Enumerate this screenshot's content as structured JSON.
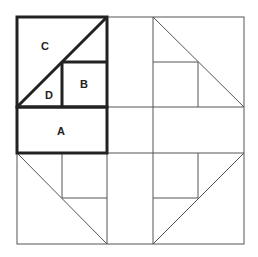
{
  "diagram": {
    "type": "quilt-block-pattern",
    "labels": {
      "a": "A",
      "b": "B",
      "c": "C",
      "d": "D"
    },
    "colors": {
      "line": "#555555",
      "thick_line": "#222222",
      "background": "#ffffff",
      "text": "#222222"
    }
  }
}
